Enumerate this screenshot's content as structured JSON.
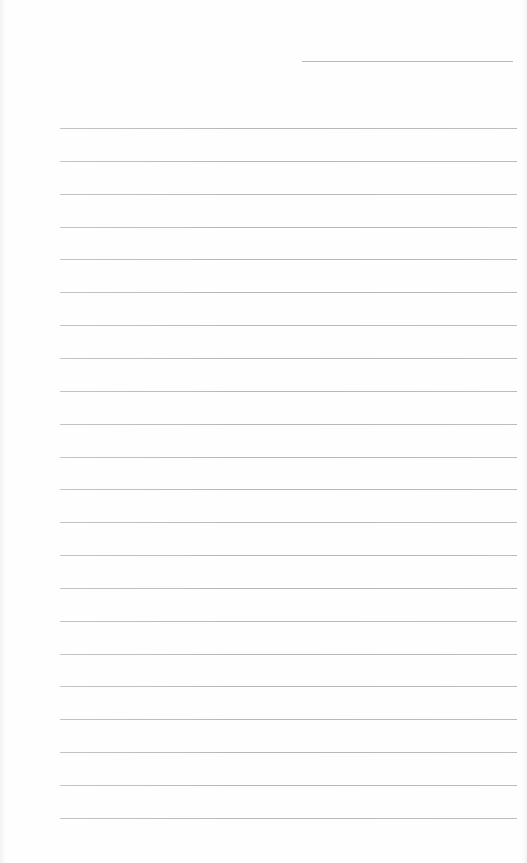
{
  "page": {
    "type": "lined-writing-sheet",
    "background_color": "#fefefe",
    "line_color": "#bcbcbc"
  },
  "header": {
    "name_line": {
      "x": 302,
      "y": 61,
      "width": 211
    }
  },
  "ruled_lines": {
    "count": 22,
    "x_start": 60,
    "x_end": 517,
    "first_y": 128,
    "spacing": 32.85
  }
}
